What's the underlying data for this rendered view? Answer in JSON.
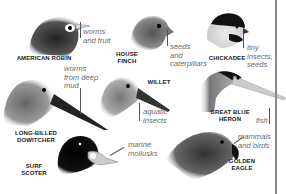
{
  "diagram": {
    "type": "bird-head-diet-illustration",
    "birds": [
      {
        "name": "AMERICAN ROBIN",
        "diet": "worms\nand fruit"
      },
      {
        "name": "HOUSE\nFINCH",
        "diet": "seeds\nand\ncaterpillars"
      },
      {
        "name": "CHICKADEE",
        "diet": "tiny\ninsects,\nseeds"
      },
      {
        "name": "LONG-BILLED\nDOWITCHER",
        "diet": "worms\nfrom deep\nmud"
      },
      {
        "name": "WILLET",
        "diet": "aquatic\ninsects"
      },
      {
        "name": "GREAT BLUE\nHERON",
        "diet": "fish"
      },
      {
        "name": "SURF\nSCOTER",
        "diet": "marine\nmollusks"
      },
      {
        "name": "GOLDEN\nEAGLE",
        "diet": "mammals\nand birds"
      }
    ]
  },
  "colors": {
    "background": "#ffffff",
    "label_text": "#1a1a1a",
    "diet_text": "#6a6a6a",
    "divider": "#8a8a8a"
  }
}
